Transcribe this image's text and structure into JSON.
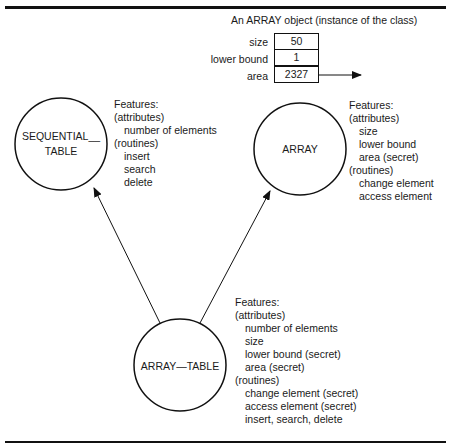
{
  "object_instance": {
    "caption": "An ARRAY object (instance of the class)",
    "fields": [
      {
        "label": "size",
        "value": "50"
      },
      {
        "label": "lower bound",
        "value": "1"
      },
      {
        "label": "area",
        "value": "2327"
      }
    ]
  },
  "classes": {
    "sequential_table": {
      "name_line1": "SEQUENTIAL__",
      "name_line2": "TABLE",
      "features_title": "Features:",
      "attributes_header": "(attributes)",
      "attributes": [
        "number of elements"
      ],
      "routines_header": "(routines)",
      "routines": [
        "insert",
        "search",
        "delete"
      ]
    },
    "array": {
      "name": "ARRAY",
      "features_title": "Features:",
      "attributes_header": "(attributes)",
      "attributes": [
        "size",
        "lower bound",
        "area (secret)"
      ],
      "routines_header": "(routines)",
      "routines": [
        "change element",
        "access element"
      ]
    },
    "array_table": {
      "name": "ARRAY—TABLE",
      "features_title": "Features:",
      "attributes_header": "(attributes)",
      "attributes": [
        "number of elements",
        "size",
        "lower bound (secret)",
        "area (secret)"
      ],
      "routines_header": "(routines)",
      "routines": [
        "change element (secret)",
        "access element (secret)",
        "insert, search, delete"
      ]
    }
  },
  "edges": [
    {
      "from": "ARRAY_TABLE",
      "to": "SEQUENTIAL_TABLE",
      "type": "inherits"
    },
    {
      "from": "ARRAY_TABLE",
      "to": "ARRAY",
      "type": "inherits"
    },
    {
      "from": "area",
      "to": "external",
      "type": "pointer"
    }
  ],
  "colors": {
    "ink": "#111111",
    "background": "#ffffff"
  }
}
